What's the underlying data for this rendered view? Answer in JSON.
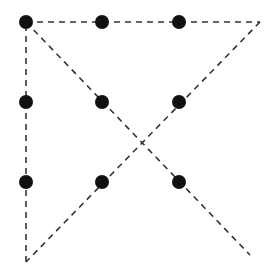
{
  "diagram": {
    "width": 276,
    "height": 280,
    "colors": {
      "dot": "#111111",
      "line": "#333333",
      "background": "#ffffff"
    },
    "dot_radius": 7,
    "dots": [
      {
        "x": 26,
        "y": 22
      },
      {
        "x": 102,
        "y": 22
      },
      {
        "x": 179,
        "y": 22
      },
      {
        "x": 26,
        "y": 102
      },
      {
        "x": 102,
        "y": 102
      },
      {
        "x": 179,
        "y": 102
      },
      {
        "x": 26,
        "y": 182
      },
      {
        "x": 102,
        "y": 182
      },
      {
        "x": 179,
        "y": 182
      }
    ],
    "path": [
      {
        "x": 26,
        "y": 22
      },
      {
        "x": 260,
        "y": 22
      },
      {
        "x": 26,
        "y": 262
      },
      {
        "x": 26,
        "y": 22
      },
      {
        "x": 250,
        "y": 255
      }
    ],
    "dash": "6,5"
  }
}
